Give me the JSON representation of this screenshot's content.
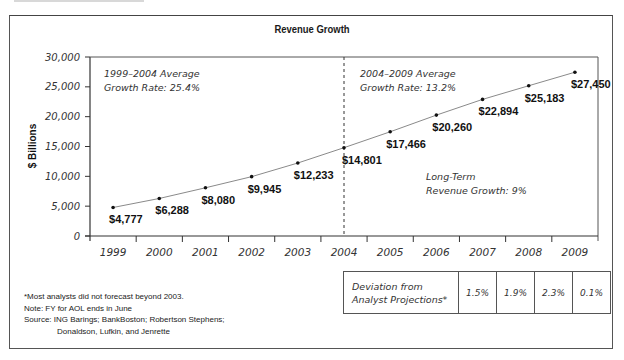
{
  "title": "Revenue Growth",
  "y_axis_title": "$ Billions",
  "annotations": {
    "period1_line1": "1999–2004 Average",
    "period1_line2": "Growth Rate: 25.4%",
    "period2_line1": "2004–2009 Average",
    "period2_line2": "Growth Rate: 13.2%",
    "longterm_line1": "Long-Term",
    "longterm_line2": "Revenue Growth: 9%"
  },
  "notes": {
    "footnote": "*Most analysts did not forecast beyond 2003.",
    "note": "Note: FY for AOL ends in June",
    "source_line1": "Source: ING Barings; BankBoston; Robertson Stephens;",
    "source_line2": "Donaldson, Lufkin, and Jenrette"
  },
  "deviation_table": {
    "label_line1": "Deviation from",
    "label_line2": "Analyst Projections*",
    "values": [
      "1.5%",
      "1.9%",
      "2.3%",
      "0.1%"
    ]
  },
  "chart_data": {
    "type": "line",
    "title": "Revenue Growth",
    "xlabel": "",
    "ylabel": "$ Billions",
    "ylim": [
      0,
      30000
    ],
    "y_ticks": [
      "0",
      "5,000",
      "10,000",
      "15,000",
      "20,000",
      "25,000",
      "30,000"
    ],
    "categories": [
      "1999",
      "2000",
      "2001",
      "2002",
      "2003",
      "2004",
      "2005",
      "2006",
      "2007",
      "2008",
      "2009"
    ],
    "values": [
      4777,
      6288,
      8080,
      9945,
      12233,
      14801,
      17466,
      20260,
      22894,
      25183,
      27450
    ],
    "data_labels": [
      "$4,777",
      "$6,288",
      "$8,080",
      "$9,945",
      "$12,233",
      "$14,801",
      "$17,466",
      "$20,260",
      "$22,894",
      "$25,183",
      "$27,450"
    ],
    "grid": false,
    "legend": "none",
    "reference_line": {
      "x": "2004",
      "style": "dashed",
      "orientation": "vertical"
    }
  }
}
